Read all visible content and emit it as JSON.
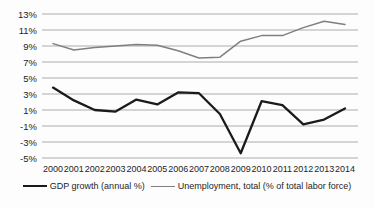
{
  "chart_data": {
    "type": "line",
    "title": "",
    "xlabel": "",
    "ylabel": "",
    "x": [
      2000,
      2001,
      2002,
      2003,
      2004,
      2005,
      2006,
      2007,
      2008,
      2009,
      2010,
      2011,
      2012,
      2013,
      2014
    ],
    "series": [
      {
        "name": "GDP growth (annual %)",
        "color": "#1b1b1b",
        "stroke_width": 2.3,
        "values": [
          3.8,
          2.2,
          1.0,
          0.8,
          2.3,
          1.7,
          3.2,
          3.1,
          0.5,
          -4.4,
          2.1,
          1.6,
          -0.8,
          -0.2,
          1.2
        ]
      },
      {
        "name": "Unemployment, total (% of total labor force)",
        "color": "#7f7f7f",
        "stroke_width": 1.5,
        "values": [
          9.3,
          8.5,
          8.8,
          9.0,
          9.2,
          9.1,
          8.4,
          7.5,
          7.6,
          9.6,
          10.3,
          10.3,
          11.3,
          12.1,
          11.7
        ]
      }
    ],
    "ylim": [
      -5,
      13
    ],
    "ytick_values": [
      13,
      11,
      9,
      7,
      5,
      3,
      1,
      -1,
      -3,
      -5
    ],
    "ytick_labels": [
      "13%",
      "11%",
      "9%",
      "7%",
      "5%",
      "3%",
      "1%",
      "-1%",
      "-3%",
      "-5%"
    ],
    "xtick_labels": [
      "2000",
      "2001",
      "2002",
      "2003",
      "2004",
      "2005",
      "2006",
      "2007",
      "2008",
      "2009",
      "2010",
      "2011",
      "2012",
      "2013",
      "2014"
    ],
    "grid": true,
    "gridline_color": "#a3a3a3",
    "tick_label_color": "#1d1d1d",
    "legend_position": "bottom"
  }
}
